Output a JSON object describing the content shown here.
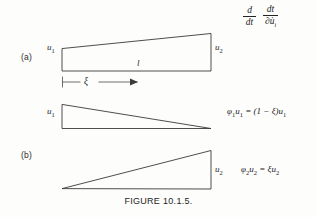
{
  "figure": {
    "caption": "FIGURE 10.1.5.",
    "panel_a_label": "(a)",
    "panel_b_label": "(b)"
  },
  "operator": {
    "first_fraction": {
      "numerator": "d",
      "denominator": "dt"
    },
    "second_fraction": {
      "numerator": "dt",
      "denominator": "∂u̇",
      "denominator_sub": "i"
    }
  },
  "panel_a": {
    "left_node_label": "u",
    "left_node_sub": "1",
    "right_node_label": "u",
    "right_node_sub": "2",
    "length_label": "l",
    "coordinate_label": "ξ"
  },
  "shape_function_1": {
    "equation_lhs": "φ",
    "equation_lhs_sub": "1",
    "equation_text": "u",
    "equation_text_sub": "1",
    "equation_rhs": " = (1 − ξ)u",
    "equation_rhs_sub": "1",
    "amplitude_label": "u",
    "amplitude_sub": "1"
  },
  "shape_function_2": {
    "equation_lhs": "φ",
    "equation_lhs_sub": "2",
    "equation_text": "u",
    "equation_text_sub": "2",
    "equation_rhs": " = ξu",
    "equation_rhs_sub": "2",
    "amplitude_label": "u",
    "amplitude_sub": "2"
  },
  "colors": {
    "ink": "#3a3a3a",
    "paper": "#fdfdfc"
  }
}
